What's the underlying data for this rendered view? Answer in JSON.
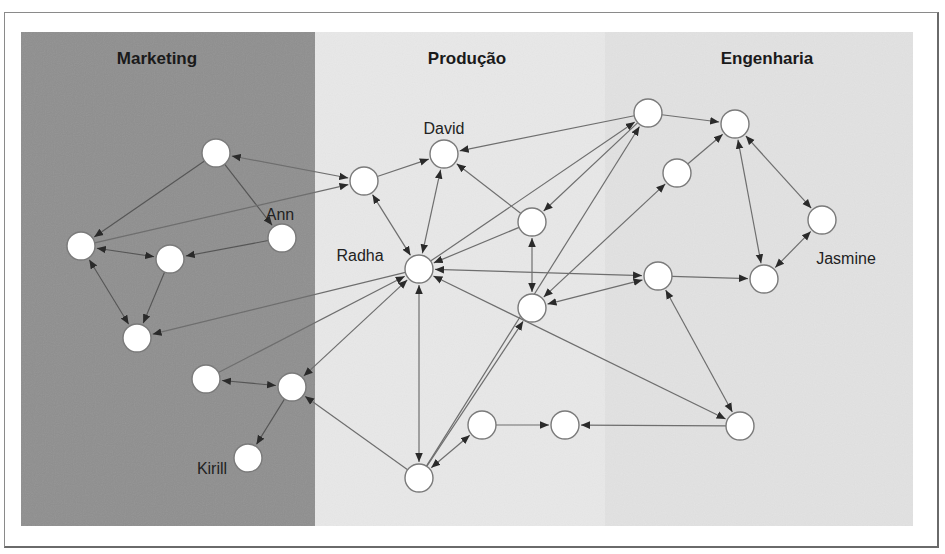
{
  "colors": {
    "marketing_bg": "#8f8f8f",
    "producao_bg": "#e8e8e8",
    "engenharia_bg": "#e2e2e2",
    "node_fill": "#ffffff",
    "node_stroke": "#7a7a7a",
    "edge": "#666666"
  },
  "departments": [
    {
      "id": "marketing",
      "label": "Marketing",
      "x": 21,
      "y": 32,
      "w": 294,
      "h": 494,
      "label_x": 157,
      "label_y": 64
    },
    {
      "id": "producao",
      "label": "Produção",
      "x": 315,
      "y": 32,
      "w": 290,
      "h": 494,
      "label_x": 467,
      "label_y": 64
    },
    {
      "id": "engenharia",
      "label": "Engenharia",
      "x": 605,
      "y": 32,
      "w": 308,
      "h": 494,
      "label_x": 767,
      "label_y": 64
    }
  ],
  "nodes": [
    {
      "id": "m1",
      "x": 216,
      "y": 153,
      "dept": "marketing"
    },
    {
      "id": "m2",
      "x": 81,
      "y": 246,
      "dept": "marketing"
    },
    {
      "id": "m3",
      "x": 170,
      "y": 259,
      "dept": "marketing"
    },
    {
      "id": "ann",
      "x": 282,
      "y": 238,
      "dept": "marketing",
      "label": "Ann",
      "lx": 280,
      "ly": 220,
      "anchor": "middle"
    },
    {
      "id": "m5",
      "x": 137,
      "y": 338,
      "dept": "marketing"
    },
    {
      "id": "m6",
      "x": 206,
      "y": 379,
      "dept": "marketing"
    },
    {
      "id": "m7",
      "x": 292,
      "y": 387,
      "dept": "marketing"
    },
    {
      "id": "kirill",
      "x": 248,
      "y": 458,
      "dept": "marketing",
      "label": "Kirill",
      "lx": 212,
      "ly": 474,
      "anchor": "middle"
    },
    {
      "id": "p1",
      "x": 364,
      "y": 181,
      "dept": "producao"
    },
    {
      "id": "david",
      "x": 444,
      "y": 154,
      "dept": "producao",
      "label": "David",
      "lx": 444,
      "ly": 134,
      "anchor": "middle"
    },
    {
      "id": "radha",
      "x": 419,
      "y": 269,
      "dept": "producao",
      "label": "Radha",
      "lx": 360,
      "ly": 261,
      "anchor": "middle"
    },
    {
      "id": "p4",
      "x": 532,
      "y": 222,
      "dept": "producao"
    },
    {
      "id": "p5",
      "x": 532,
      "y": 308,
      "dept": "producao"
    },
    {
      "id": "p6",
      "x": 482,
      "y": 425,
      "dept": "producao"
    },
    {
      "id": "p7",
      "x": 565,
      "y": 425,
      "dept": "producao"
    },
    {
      "id": "p8",
      "x": 419,
      "y": 478,
      "dept": "producao"
    },
    {
      "id": "e1",
      "x": 648,
      "y": 113,
      "dept": "engenharia"
    },
    {
      "id": "e2",
      "x": 735,
      "y": 124,
      "dept": "engenharia"
    },
    {
      "id": "e3",
      "x": 677,
      "y": 173,
      "dept": "engenharia"
    },
    {
      "id": "e4",
      "x": 822,
      "y": 220,
      "dept": "engenharia"
    },
    {
      "id": "e5",
      "x": 658,
      "y": 276,
      "dept": "engenharia"
    },
    {
      "id": "jasmine",
      "x": 764,
      "y": 279,
      "dept": "engenharia",
      "label": "Jasmine",
      "lx": 846,
      "ly": 264,
      "anchor": "middle"
    },
    {
      "id": "e7",
      "x": 740,
      "y": 426,
      "dept": "engenharia"
    }
  ],
  "edges": [
    {
      "from": "m1",
      "to": "p1",
      "both": true
    },
    {
      "from": "m1",
      "to": "m2",
      "both": false
    },
    {
      "from": "m1",
      "to": "ann",
      "both": false
    },
    {
      "from": "m2",
      "to": "p1",
      "both": false
    },
    {
      "from": "m2",
      "to": "m3",
      "both": true
    },
    {
      "from": "ann",
      "to": "m3",
      "both": false
    },
    {
      "from": "m2",
      "to": "m5",
      "both": true
    },
    {
      "from": "m3",
      "to": "m5",
      "both": false
    },
    {
      "from": "radha",
      "to": "m5",
      "both": false
    },
    {
      "from": "m6",
      "to": "m7",
      "both": true
    },
    {
      "from": "m6",
      "to": "radha",
      "both": false
    },
    {
      "from": "m7",
      "to": "radha",
      "both": true
    },
    {
      "from": "m7",
      "to": "kirill",
      "both": false
    },
    {
      "from": "p8",
      "to": "m7",
      "both": false
    },
    {
      "from": "p1",
      "to": "david",
      "both": false
    },
    {
      "from": "p1",
      "to": "radha",
      "both": true
    },
    {
      "from": "david",
      "to": "radha",
      "both": true
    },
    {
      "from": "e1",
      "to": "david",
      "both": false
    },
    {
      "from": "p4",
      "to": "david",
      "both": false
    },
    {
      "from": "p4",
      "to": "radha",
      "both": false
    },
    {
      "from": "radha",
      "to": "e1",
      "both": false
    },
    {
      "from": "p8",
      "to": "e1",
      "both": false
    },
    {
      "from": "e1",
      "to": "p4",
      "both": false
    },
    {
      "from": "p4",
      "to": "p5",
      "both": true
    },
    {
      "from": "radha",
      "to": "e5",
      "both": true
    },
    {
      "from": "e3",
      "to": "p5",
      "both": true
    },
    {
      "from": "e5",
      "to": "p5",
      "both": true
    },
    {
      "from": "p8",
      "to": "p5",
      "both": false
    },
    {
      "from": "radha",
      "to": "p8",
      "both": true
    },
    {
      "from": "p8",
      "to": "p6",
      "both": true
    },
    {
      "from": "p6",
      "to": "p7",
      "both": false
    },
    {
      "from": "e7",
      "to": "p7",
      "both": false
    },
    {
      "from": "radha",
      "to": "e7",
      "both": true
    },
    {
      "from": "e1",
      "to": "e2",
      "both": false
    },
    {
      "from": "e3",
      "to": "e2",
      "both": false
    },
    {
      "from": "e2",
      "to": "e4",
      "both": true
    },
    {
      "from": "e2",
      "to": "jasmine",
      "both": true
    },
    {
      "from": "e4",
      "to": "jasmine",
      "both": true
    },
    {
      "from": "e5",
      "to": "jasmine",
      "both": false
    },
    {
      "from": "e5",
      "to": "e7",
      "both": true
    }
  ],
  "node_radius": 14
}
